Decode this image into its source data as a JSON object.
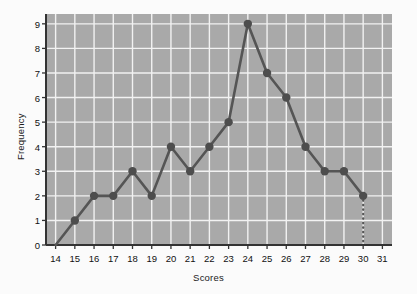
{
  "chart_data": {
    "type": "line",
    "title": "",
    "subtitle": "",
    "xlabel": "Scores",
    "ylabel": "Frequency",
    "x": [
      14,
      15,
      16,
      17,
      18,
      19,
      20,
      21,
      22,
      23,
      24,
      25,
      26,
      27,
      28,
      29,
      30
    ],
    "values": [
      0,
      1,
      2,
      2,
      3,
      2,
      4,
      3,
      4,
      5,
      9,
      7,
      6,
      4,
      3,
      3,
      2
    ],
    "series": [
      {
        "name": "Frequency",
        "values": [
          0,
          1,
          2,
          2,
          3,
          2,
          4,
          3,
          4,
          5,
          9,
          7,
          6,
          4,
          3,
          3,
          2
        ]
      }
    ],
    "xlim": [
      13.5,
      31.5
    ],
    "ylim": [
      0,
      9.4
    ],
    "xticks": [
      14,
      15,
      16,
      17,
      18,
      19,
      20,
      21,
      22,
      23,
      24,
      25,
      26,
      27,
      28,
      29,
      30,
      31
    ],
    "xtick_labels": [
      "14",
      "15",
      "16",
      "17",
      "18",
      "19",
      "20",
      "21",
      "22",
      "23",
      "24",
      "25",
      "26",
      "27",
      "28",
      "29",
      "30",
      "31"
    ],
    "yticks": [
      0,
      1,
      2,
      3,
      4,
      5,
      6,
      7,
      8,
      9
    ],
    "ytick_labels": [
      "0",
      "1",
      "2",
      "3",
      "4",
      "5",
      "6",
      "7",
      "8",
      "9"
    ],
    "grid": true,
    "legend": false,
    "legend_position": "none",
    "annotations": [
      {
        "kind": "dotted-drop-line",
        "x": 30,
        "y_from": 2,
        "y_to": 0
      }
    ],
    "colors": {
      "plot_background": "#a9a9a9",
      "figure_background": "#fbfbfb",
      "gridline": "#f2f2f2",
      "series_line": "#555555",
      "marker_fill": "#4d4d4d",
      "axis_line": "#333333",
      "tick_text": "#111111"
    },
    "style": {
      "line_width": 2.6,
      "marker": "circle",
      "marker_size": 4.2,
      "dotted_line_width": 2.2
    }
  }
}
